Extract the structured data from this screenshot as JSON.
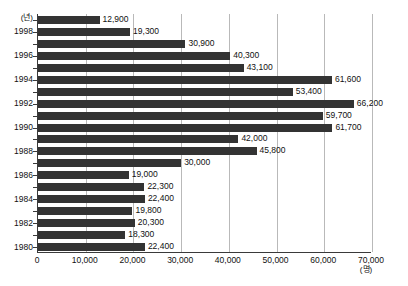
{
  "chart_data": {
    "type": "bar",
    "orientation": "horizontal",
    "title": "",
    "subtitle": "",
    "xlabel": "(명)",
    "ylabel": "(년)",
    "xlim": [
      0,
      70000
    ],
    "xtick_step": 10000,
    "xticks": [
      "0",
      "10,000",
      "20,000",
      "30,000",
      "40,000",
      "50,000",
      "60,000",
      "70,000"
    ],
    "xtick_values": [
      0,
      10000,
      20000,
      30000,
      40000,
      50000,
      60000,
      70000
    ],
    "grid": "vertical",
    "legend": "none",
    "categories": [
      "1999",
      "1998",
      "1997",
      "1996",
      "1995",
      "1994",
      "1993",
      "1992",
      "1991",
      "1990",
      "1989",
      "1988",
      "1987",
      "1986",
      "1985",
      "1984",
      "1983",
      "1982",
      "1981",
      "1980"
    ],
    "ytick_labels_shown": [
      "1998",
      "1996",
      "1994",
      "1992",
      "1990",
      "1988",
      "1986",
      "1984",
      "1982",
      "1980"
    ],
    "values": [
      12900,
      19300,
      30900,
      40300,
      43100,
      61600,
      53400,
      66200,
      59700,
      61700,
      42000,
      45800,
      30000,
      19000,
      22300,
      22400,
      19800,
      20300,
      18300,
      22400
    ],
    "value_labels": [
      "12,900",
      "19,300",
      "30,900",
      "40,300",
      "43,100",
      "61,600",
      "53,400",
      "66,200",
      "59,700",
      "61,700",
      "42,000",
      "45,800",
      "30,000",
      "19,000",
      "22,300",
      "22,400",
      "19,800",
      "20,300",
      "18,300",
      "22,400"
    ],
    "bar_color": "#333333",
    "grid_color": "#b9b9b9",
    "axis_color": "#3a3a3a"
  }
}
